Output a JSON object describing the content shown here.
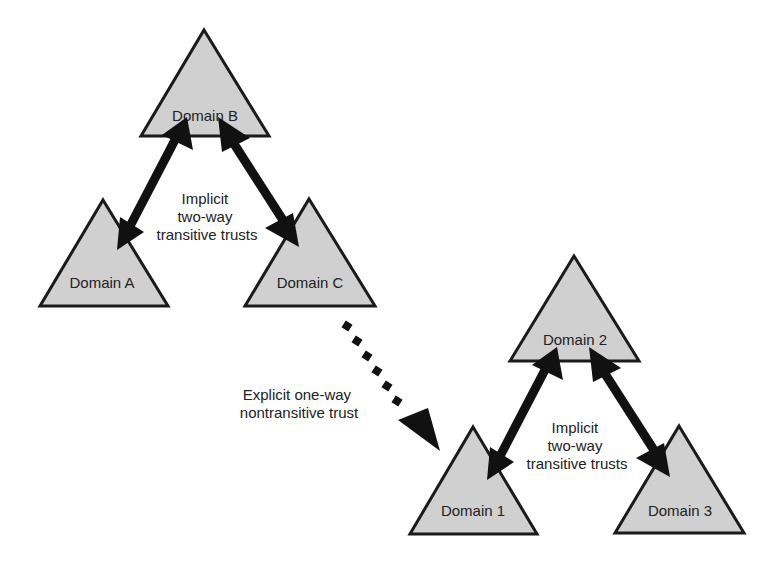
{
  "diagram": {
    "forest_1": {
      "domains": [
        {
          "id": "domain-b",
          "label": "Domain B"
        },
        {
          "id": "domain-a",
          "label": "Domain A"
        },
        {
          "id": "domain-c",
          "label": "Domain C"
        }
      ],
      "trust_label": [
        "Implicit",
        "two-way",
        "transitive trusts"
      ]
    },
    "forest_2": {
      "domains": [
        {
          "id": "domain-2",
          "label": "Domain 2"
        },
        {
          "id": "domain-1",
          "label": "Domain 1"
        },
        {
          "id": "domain-3",
          "label": "Domain 3"
        }
      ],
      "trust_label": [
        "Implicit",
        "two-way",
        "transitive trusts"
      ]
    },
    "explicit_trust": {
      "label": [
        "Explicit one-way",
        "nontransitive trust"
      ],
      "from": "Domain C",
      "to": "Domain 1"
    },
    "colors": {
      "triangle_fill": "#d0d0d0",
      "outline": "#1a1a1a",
      "arrow": "#111111",
      "text": "#222222",
      "background": "#ffffff"
    }
  }
}
